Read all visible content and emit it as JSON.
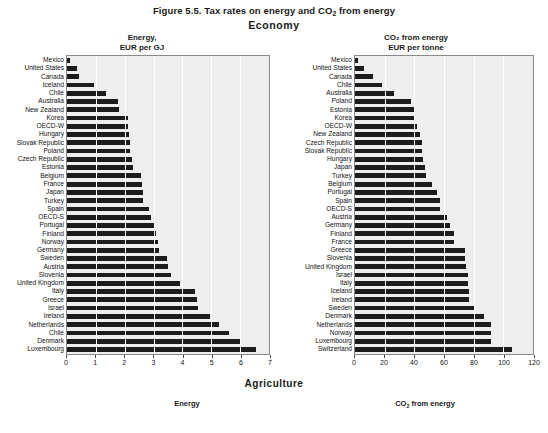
{
  "figure": {
    "title_prefix": "Figure 5.5. Tax rates on energy and CO",
    "title_sub": "2",
    "title_suffix": " from energy",
    "section_economy": "Economy",
    "section_agriculture": "Agriculture"
  },
  "bottom_captions": {
    "energy": "Energy",
    "co2_prefix": "CO",
    "co2_sub": "2",
    "co2_suffix": " from energy"
  },
  "colors": {
    "bar": "#1c1c1c",
    "plot_background": "#eeeeee",
    "gridline": "#ffffff",
    "axis": "#8a8a8a",
    "text": "#111111"
  },
  "chart_data": [
    {
      "type": "bar",
      "orientation": "horizontal",
      "id": "economy-energy",
      "title": "Energy, EUR per GJ",
      "title_lines": [
        "Energy,",
        "EUR per GJ"
      ],
      "xlabel": "",
      "ylabel": "",
      "xlim": [
        0,
        7
      ],
      "xticks": [
        0,
        1,
        2,
        3,
        4,
        5,
        6,
        7
      ],
      "xticklabels": [
        "0",
        "1",
        "2",
        "3",
        "4",
        "5",
        "6",
        "7"
      ],
      "grid": true,
      "legend": "none",
      "categories": [
        "Mexico",
        "United States",
        "Canada",
        "Iceland",
        "Chile",
        "Australia",
        "New Zealand",
        "Korea",
        "OECD-W",
        "Hungary",
        "Slovak Republic",
        "Poland",
        "Czech Republic",
        "Estonia",
        "Belgium",
        "France",
        "Japan",
        "Turkey",
        "Spain",
        "OECD-S",
        "Portugal",
        "Finland",
        "Norway",
        "Germany",
        "Sweden",
        "Austria",
        "Slovenia",
        "United Kingdom",
        "Italy",
        "Greece",
        "Israel",
        "Ireland",
        "Netherlands",
        "Chile",
        "Denmark",
        "Luxembourg"
      ],
      "values": [
        0.12,
        0.35,
        0.42,
        0.95,
        1.35,
        1.75,
        1.8,
        2.1,
        2.12,
        2.15,
        2.18,
        2.2,
        2.25,
        2.3,
        2.55,
        2.6,
        2.62,
        2.65,
        2.85,
        2.9,
        3.05,
        3.1,
        3.15,
        3.2,
        3.45,
        3.5,
        3.6,
        3.9,
        4.45,
        4.5,
        4.55,
        4.95,
        5.25,
        5.6,
        6.0,
        6.55
      ]
    },
    {
      "type": "bar",
      "orientation": "horizontal",
      "id": "economy-co2",
      "title": "CO2 from energy, EUR per tonne",
      "title_lines": [
        "CO₂ from energy",
        "EUR per tonne"
      ],
      "xlabel": "",
      "ylabel": "",
      "xlim": [
        0,
        120
      ],
      "xticks": [
        0,
        20,
        40,
        60,
        80,
        100,
        120
      ],
      "xticklabels": [
        "0",
        "20",
        "40",
        "60",
        "80",
        "100",
        "120"
      ],
      "grid": true,
      "legend": "none",
      "categories": [
        "Mexico",
        "United States",
        "Canada",
        "Chile",
        "Australia",
        "Poland",
        "Estonia",
        "Korea",
        "OECD-W",
        "New Zealand",
        "Czech Republic",
        "Slovak Republic",
        "Hungary",
        "Japan",
        "Turkey",
        "Belgium",
        "Portugal",
        "Spain",
        "OECD-S",
        "Austria",
        "Germany",
        "Finland",
        "France",
        "Greece",
        "Slovenia",
        "United Kingdom",
        "Israel",
        "Italy",
        "Iceland",
        "Ireland",
        "Sweden",
        "Denmark",
        "Netherlands",
        "Norway",
        "Luxembourg",
        "Switzerland"
      ],
      "values": [
        2,
        6,
        12,
        18,
        26,
        38,
        40,
        40,
        42,
        44,
        45,
        45,
        46,
        47,
        48,
        52,
        55,
        57,
        57,
        62,
        64,
        67,
        67,
        74,
        74,
        75,
        76,
        76,
        77,
        77,
        80,
        87,
        92,
        92,
        92,
        106
      ]
    }
  ]
}
